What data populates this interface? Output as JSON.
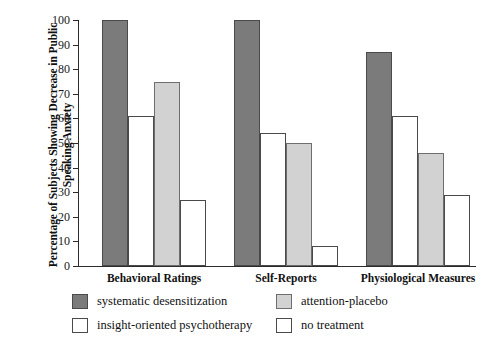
{
  "chart_data": {
    "type": "bar",
    "title": "",
    "xlabel": "",
    "ylabel": "Percentage of Subjects Showing Decrease in Public Speaking Anxiety",
    "ylim": [
      0,
      100
    ],
    "yticks": [
      0,
      10,
      20,
      30,
      40,
      50,
      60,
      70,
      80,
      90,
      100
    ],
    "grid": false,
    "legend_position": "below-axes",
    "categories": [
      "Behavioral Ratings",
      "Self-Reports",
      "Physiological Measures"
    ],
    "series": [
      {
        "name": "systematic desensitization",
        "color": "#7b7b7b",
        "swatch": "dark",
        "values": [
          100,
          100,
          87
        ]
      },
      {
        "name": "insight-oriented psychotherapy",
        "color": "#ffffff",
        "swatch": "white",
        "values": [
          61,
          54,
          61
        ]
      },
      {
        "name": "attention-placebo",
        "color": "#d2d2d2",
        "swatch": "light",
        "values": [
          75,
          50,
          46
        ]
      },
      {
        "name": "no treatment",
        "color": "#ffffff",
        "swatch": "white",
        "values": [
          27,
          8,
          29
        ]
      }
    ],
    "legend_order": [
      "systematic desensitization",
      "attention-placebo",
      "insight-oriented psychotherapy",
      "no treatment"
    ]
  },
  "axis": {
    "tick_labels": [
      "100",
      "90",
      "80",
      "70",
      "60",
      "50",
      "40",
      "30",
      "20",
      "10",
      "0"
    ]
  },
  "legend": {
    "items": [
      {
        "label": "systematic desensitization",
        "swatch": "dark"
      },
      {
        "label": "attention-placebo",
        "swatch": "light"
      },
      {
        "label": "insight-oriented psychotherapy",
        "swatch": "white"
      },
      {
        "label": "no treatment",
        "swatch": "white"
      }
    ]
  }
}
